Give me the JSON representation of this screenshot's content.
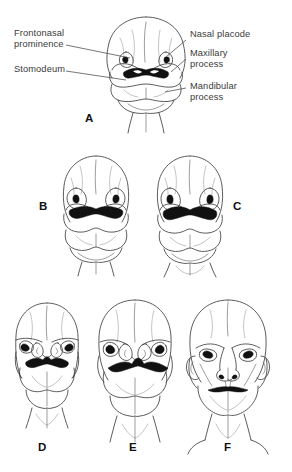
{
  "figure": {
    "kind": "anatomical-line-drawing",
    "background_color": "#ffffff",
    "ink_color": "#3a3a3a",
    "shadow_color": "#111111"
  },
  "labels": {
    "frontonasal_prominence": "Frontonasal\nprominence",
    "stomodeum": "Stomodeum",
    "nasal_placode": "Nasal placode",
    "maxillary_process": "Maxillary\nprocess",
    "mandibular_process": "Mandibular\nprocess"
  },
  "panels": [
    {
      "id": "A",
      "letter": "A",
      "stage": "earliest",
      "description": "Frontonasal prominence with nasal placodes, stomodeum, maxillary and mandibular processes"
    },
    {
      "id": "B",
      "letter": "B",
      "stage": "early",
      "description": "Nasal pits deepening, broad stomodeum"
    },
    {
      "id": "C",
      "letter": "C",
      "stage": "early-mid",
      "description": "Nasal pits deepening, maxillary processes enlarging"
    },
    {
      "id": "D",
      "letter": "D",
      "stage": "mid",
      "description": "Medial and lateral nasal prominences forming"
    },
    {
      "id": "E",
      "letter": "E",
      "stage": "late-mid",
      "description": "Nasal prominences merging, eyes moving forward"
    },
    {
      "id": "F",
      "letter": "F",
      "stage": "late",
      "description": "Recognizable fetal face with formed nose, mouth and ears"
    }
  ],
  "caption_partial": ""
}
